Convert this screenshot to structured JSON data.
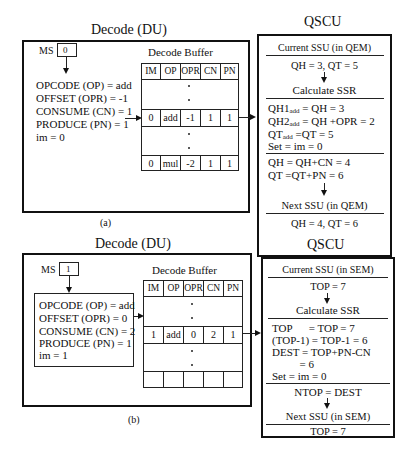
{
  "figure_a": {
    "label": "(a)",
    "decode_unit": {
      "title": "Decode  (DU)",
      "ms_label": "MS",
      "ms_value": "0",
      "fields": [
        "OPCODE (OP) =  add",
        "OFFSET (OPR) = -1",
        "CONSUME (CN) = 1",
        "PRODUCE (PN) = 1",
        "im = 0"
      ],
      "buffer": {
        "title": "Decode Buffer",
        "headers": [
          "IM",
          "OP",
          "OPR",
          "CN",
          "PN"
        ],
        "row1": [
          "0",
          "add",
          "-1",
          "1",
          "1"
        ],
        "row2": [
          "0",
          "mul",
          "-2",
          "1",
          "1"
        ]
      }
    },
    "qscu": {
      "title": "QSCU",
      "current_ssu": "Current SSU (in QEM)",
      "current_values": "QH = 3, QT = 5",
      "calculate": "Calculate SSR",
      "calc_lines": [
        {
          "pre": "QH1",
          "sub": "add",
          "post": " = QH = 3"
        },
        {
          "pre": "QH2",
          "sub": "add",
          "post": " = QH +OPR = 2"
        },
        {
          "pre": "QT",
          "sub": "add",
          "post": " =QT = 5"
        },
        {
          "pre": "Set = im = 0",
          "sub": "",
          "post": ""
        }
      ],
      "update_lines": [
        "QH  = QH+CN = 4",
        "QT  =QT+PN = 6"
      ],
      "next_ssu": "Next SSU (in QEM)",
      "next_values": "QH = 4, QT = 6"
    }
  },
  "figure_b": {
    "label": "(b)",
    "decode_unit": {
      "title": "Decode  (DU)",
      "ms_label": "MS",
      "ms_value": "1",
      "fields": [
        "OPCODE (OP) =  add",
        "OFFSET (OPR) = 0",
        "CONSUME (CN) = 2",
        "PRODUCE (PN) = 1",
        "im = 1"
      ],
      "buffer": {
        "title": "Decode Buffer",
        "headers": [
          "IM",
          "OP",
          "OPR",
          "CN",
          "PN"
        ],
        "row1": [
          "1",
          "add",
          "0",
          "2",
          "1"
        ],
        "row2": [
          "",
          "",
          "",
          "",
          ""
        ]
      }
    },
    "qscu": {
      "title": "QSCU",
      "current_ssu": "Current SSU (in SEM)",
      "current_values": "TOP = 7",
      "calculate": "Calculate SSR",
      "calc_lines": [
        "TOP      = TOP = 7",
        "(TOP-1) = TOP-1 = 6",
        "DEST = TOP+PN-CN",
        "          = 6",
        "Set = im = 0"
      ],
      "update_lines": [
        "NTOP = DEST"
      ],
      "next_ssu": "Next SSU (in SEM)",
      "next_values": "TOP = 7"
    }
  }
}
